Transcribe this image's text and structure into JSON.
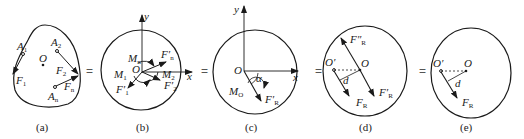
{
  "panels": [
    {
      "caption": "(a)",
      "labels": {
        "A1": "A",
        "A1s": "1",
        "A2": "A",
        "A2s": "2",
        "An": "A",
        "Ans": "n",
        "O": "O",
        "F1": "F",
        "F1s": "1",
        "F2": "F",
        "F2s": "2",
        "Fn": "F",
        "Fns": "n"
      }
    },
    {
      "caption": "(b)",
      "labels": {
        "y": "y",
        "x": "x",
        "O": "O",
        "Mn": "M",
        "Mns": "n",
        "M1": "M",
        "M1s": "1",
        "M2": "M",
        "M2s": "2",
        "Fn": "F′",
        "Fns": "n",
        "F1": "F′",
        "F1s": "1",
        "F2": "F′",
        "F2s": "2"
      }
    },
    {
      "caption": "(c)",
      "labels": {
        "y": "y",
        "x": "x",
        "O": "O",
        "alpha": "α",
        "MO": "M",
        "MOs": "O",
        "FR": "F′",
        "FRs": "R"
      }
    },
    {
      "caption": "(d)",
      "labels": {
        "FRpp": "F″",
        "FRpps": "R",
        "Op": "O′",
        "O": "O",
        "d": "d",
        "FR": "F",
        "FRs": "R",
        "FRp": "F′",
        "FRps": "R"
      }
    },
    {
      "caption": "(e)",
      "labels": {
        "Op": "O′",
        "O": "O",
        "d": "d",
        "FR": "F",
        "FRs": "R"
      }
    }
  ],
  "equals": [
    "=",
    "=",
    "=",
    "="
  ]
}
